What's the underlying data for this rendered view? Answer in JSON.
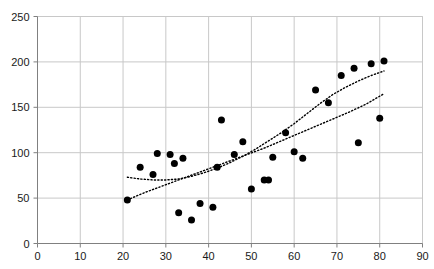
{
  "chart_data": {
    "type": "scatter",
    "title": "",
    "subtitle": "",
    "xlabel": "",
    "ylabel": "",
    "xlim": [
      0,
      90
    ],
    "ylim": [
      0,
      250
    ],
    "xticks": [
      0,
      10,
      20,
      30,
      40,
      50,
      60,
      70,
      80,
      90
    ],
    "yticks": [
      0,
      50,
      100,
      150,
      200,
      250
    ],
    "xtick_labels": [
      "0",
      "10",
      "20",
      "30",
      "40",
      "50",
      "60",
      "70",
      "80",
      "90"
    ],
    "ytick_labels": [
      "0",
      "50",
      "100",
      "150",
      "200",
      "250"
    ],
    "grid": true,
    "grid_x": true,
    "grid_y": true,
    "legend": false,
    "legend_position": "none",
    "annotations": [],
    "marker": {
      "shape": "circle",
      "color": "#000000",
      "size_px": 7
    },
    "series": [
      {
        "name": "observations",
        "type": "scatter",
        "color": "#000000",
        "points": [
          [
            21,
            48
          ],
          [
            24,
            84
          ],
          [
            27,
            76
          ],
          [
            28,
            99
          ],
          [
            31,
            98
          ],
          [
            32,
            88
          ],
          [
            33,
            34
          ],
          [
            34,
            94
          ],
          [
            36,
            26
          ],
          [
            38,
            44
          ],
          [
            41,
            40
          ],
          [
            42,
            84
          ],
          [
            43,
            136
          ],
          [
            46,
            98
          ],
          [
            48,
            112
          ],
          [
            50,
            60
          ],
          [
            53,
            70
          ],
          [
            54,
            70
          ],
          [
            55,
            95
          ],
          [
            58,
            122
          ],
          [
            60,
            101
          ],
          [
            62,
            94
          ],
          [
            65,
            169
          ],
          [
            68,
            155
          ],
          [
            71,
            185
          ],
          [
            74,
            193
          ],
          [
            75,
            111
          ],
          [
            78,
            198
          ],
          [
            80,
            138
          ],
          [
            81,
            201
          ]
        ]
      },
      {
        "name": "fit-curve-upper",
        "type": "line",
        "style": "dotted",
        "color": "#000000",
        "points": [
          [
            21,
            73
          ],
          [
            24,
            71
          ],
          [
            27,
            70
          ],
          [
            30,
            70
          ],
          [
            33,
            71
          ],
          [
            36,
            74
          ],
          [
            39,
            78
          ],
          [
            42,
            83
          ],
          [
            45,
            89
          ],
          [
            48,
            96
          ],
          [
            51,
            104
          ],
          [
            54,
            113
          ],
          [
            57,
            122
          ],
          [
            60,
            132
          ],
          [
            63,
            143
          ],
          [
            66,
            154
          ],
          [
            69,
            164
          ],
          [
            72,
            172
          ],
          [
            75,
            179
          ],
          [
            78,
            185
          ],
          [
            81,
            190
          ]
        ]
      },
      {
        "name": "fit-curve-lower",
        "type": "line",
        "style": "dotted",
        "color": "#000000",
        "points": [
          [
            21,
            48
          ],
          [
            25,
            56
          ],
          [
            29,
            63
          ],
          [
            33,
            70
          ],
          [
            37,
            77
          ],
          [
            41,
            84
          ],
          [
            45,
            91
          ],
          [
            49,
            98
          ],
          [
            53,
            105
          ],
          [
            57,
            113
          ],
          [
            61,
            121
          ],
          [
            65,
            129
          ],
          [
            69,
            137
          ],
          [
            73,
            145
          ],
          [
            77,
            154
          ],
          [
            81,
            165
          ]
        ]
      }
    ]
  },
  "axes": {
    "x_axis_name": "x-axis",
    "y_axis_name": "y-axis"
  },
  "style": {
    "background": "#ffffff",
    "grid_color": "#c8c8c8",
    "axis_color": "#808080",
    "text_color": "#1a1a1a",
    "marker_color": "#000000",
    "fit_line_color": "#000000"
  }
}
